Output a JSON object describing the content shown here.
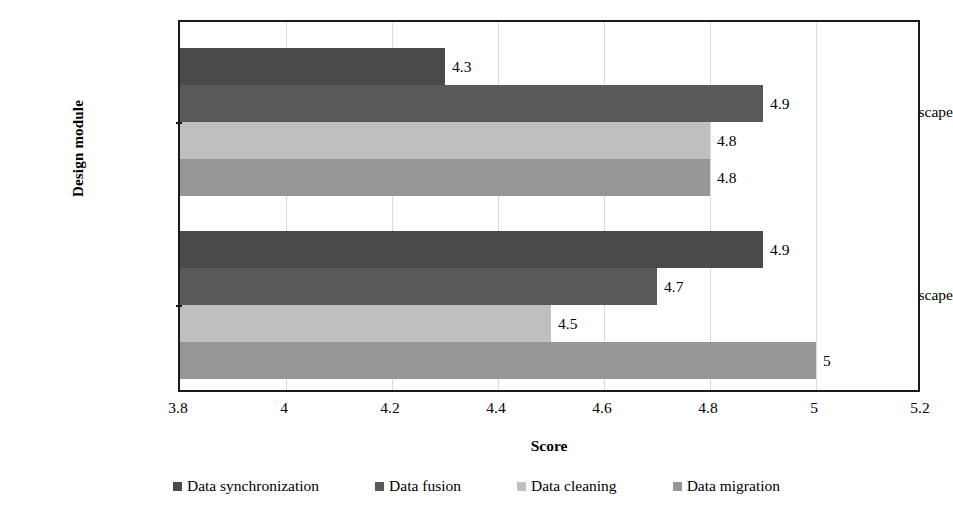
{
  "chart_data": {
    "type": "bar",
    "orientation": "horizontal",
    "title": "",
    "xlabel": "Score",
    "ylabel": "Design module",
    "categories": [
      "Soft landscape",
      "Hard landscape"
    ],
    "series": [
      {
        "name": "Data synchronization",
        "color": "#4a4a4a",
        "values": [
          4.3,
          4.9
        ]
      },
      {
        "name": "Data fusion",
        "color": "#595959",
        "values": [
          4.9,
          4.7
        ]
      },
      {
        "name": "Data cleaning",
        "color": "#bfbfbf",
        "values": [
          4.8,
          4.5
        ]
      },
      {
        "name": "Data migration",
        "color": "#969696",
        "values": [
          4.8,
          5
        ]
      }
    ],
    "data_labels": [
      [
        "4.3",
        "4.9",
        "4.8",
        "4.8"
      ],
      [
        "4.9",
        "4.7",
        "4.5",
        "5"
      ]
    ],
    "xlim": [
      3.8,
      5.2
    ],
    "xticks": [
      3.8,
      4,
      4.2,
      4.4,
      4.6,
      4.8,
      5,
      5.2
    ],
    "xtick_labels": [
      "3.8",
      "4",
      "4.2",
      "4.4",
      "4.6",
      "4.8",
      "5",
      "5.2"
    ],
    "grid": "vertical",
    "legend_position": "bottom",
    "plot_border_color": "#1a1a1a",
    "gridline_color": "#d9d9d9"
  },
  "axes": {
    "y_title": "Design module",
    "x_title": "Score",
    "y_categories": {
      "soft": "Soft landscape",
      "hard": "Hard landscape"
    }
  },
  "legend": {
    "items": [
      {
        "label": "Data synchronization"
      },
      {
        "label": "Data fusion"
      },
      {
        "label": "Data cleaning"
      },
      {
        "label": "Data migration"
      }
    ]
  }
}
